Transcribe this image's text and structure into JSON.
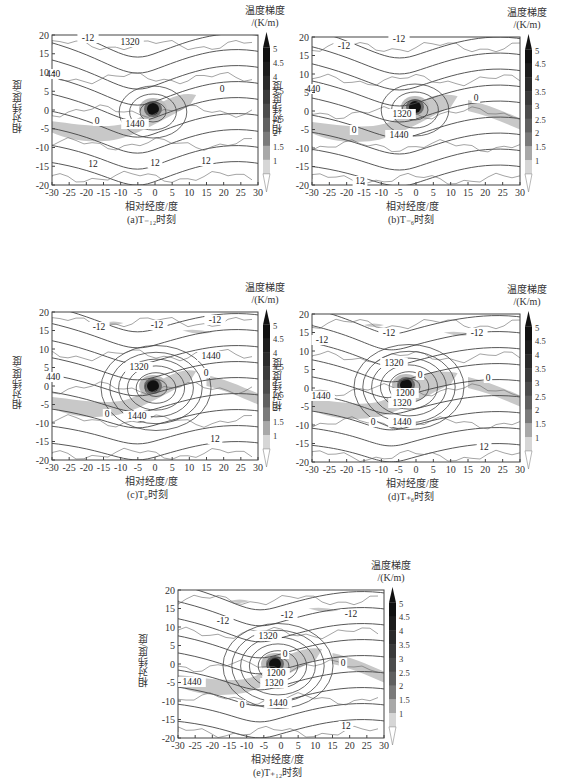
{
  "figure": {
    "colorbar": {
      "title_line1": "温度梯度",
      "title_line2": "/(K/m)",
      "ticks": [
        "5",
        "4.5",
        "4",
        "3.5",
        "3",
        "2.5",
        "2",
        "1.5",
        "1"
      ],
      "shades": [
        "#111111",
        "#1d1d1d",
        "#2a2a2a",
        "#3a3a3a",
        "#4c4c4c",
        "#606060",
        "#7a7a7a",
        "#a8a8a8",
        "#d6d6d6"
      ]
    },
    "xlabel": "相对经度/度",
    "ylabel": "相对纬度/度",
    "xticks": [
      "-30",
      "-25",
      "-20",
      "-15",
      "-10",
      "-5",
      "0",
      "5",
      "10",
      "15",
      "20",
      "25",
      "30"
    ],
    "yticks": [
      "20",
      "15",
      "10",
      "5",
      "0",
      "-5",
      "-10",
      "-15",
      "-20"
    ],
    "panels": [
      {
        "id": "a",
        "caption": "(a)T₋₁₂时刻"
      },
      {
        "id": "b",
        "caption": "(b)T₋₆时刻"
      },
      {
        "id": "c",
        "caption": "(c)T₀时刻"
      },
      {
        "id": "d",
        "caption": "(d)T₊₆时刻"
      },
      {
        "id": "e",
        "caption": "(e)T₊₁₂时刻"
      }
    ]
  },
  "chart_data": [
    {
      "type": "heatmap",
      "title": "(a)T₋₁₂时刻",
      "xlabel": "相对经度/度",
      "ylabel": "相对纬度/度",
      "xlim": [
        -30,
        30
      ],
      "ylim": [
        -20,
        20
      ],
      "colorbar": {
        "label": "温度梯度/(K/m)",
        "range": [
          1,
          5
        ],
        "ticks": [
          1,
          1.5,
          2,
          2.5,
          3,
          3.5,
          4,
          4.5,
          5
        ]
      },
      "contour_labels": [
        "-12",
        "1320",
        "440",
        "0",
        "1440",
        "12",
        "12",
        "12"
      ],
      "max_gradient_center": [
        0,
        0
      ]
    },
    {
      "type": "heatmap",
      "title": "(b)T₋₆时刻",
      "xlabel": "相对经度/度",
      "ylabel": "相对纬度/度",
      "xlim": [
        -30,
        30
      ],
      "ylim": [
        -20,
        20
      ],
      "colorbar": {
        "label": "温度梯度/(K/m)",
        "range": [
          1,
          5
        ],
        "ticks": [
          1,
          1.5,
          2,
          2.5,
          3,
          3.5,
          4,
          4.5,
          5
        ]
      },
      "contour_labels": [
        "-12",
        "-12",
        "440",
        "0",
        "1320",
        "1440",
        "0",
        "12"
      ],
      "max_gradient_center": [
        0,
        1
      ]
    },
    {
      "type": "heatmap",
      "title": "(c)T₀时刻",
      "xlabel": "相对经度/度",
      "ylabel": "相对纬度/度",
      "xlim": [
        -30,
        30
      ],
      "ylim": [
        -20,
        20
      ],
      "colorbar": {
        "label": "温度梯度/(K/m)",
        "range": [
          1,
          5
        ],
        "ticks": [
          1,
          1.5,
          2,
          2.5,
          3,
          3.5,
          4,
          4.5,
          5
        ]
      },
      "contour_labels": [
        "-12",
        "-12",
        "-12",
        "1440",
        "1320",
        "440",
        "0",
        "0",
        "1440",
        "12"
      ],
      "max_gradient_center": [
        0,
        0
      ]
    },
    {
      "type": "heatmap",
      "title": "(d)T₊₆时刻",
      "xlabel": "相对经度/度",
      "ylabel": "相对纬度/度",
      "xlim": [
        -30,
        30
      ],
      "ylim": [
        -20,
        20
      ],
      "colorbar": {
        "label": "温度梯度/(K/m)",
        "range": [
          1,
          5
        ],
        "ticks": [
          1,
          1.5,
          2,
          2.5,
          3,
          3.5,
          4,
          4.5,
          5
        ]
      },
      "contour_labels": [
        "-12",
        "-12",
        "-12",
        "1320",
        "0",
        "0",
        "1200",
        "1440",
        "1320",
        "0",
        "1440",
        "12"
      ],
      "max_gradient_center": [
        -1,
        0
      ]
    },
    {
      "type": "heatmap",
      "title": "(e)T₊₁₂时刻",
      "xlabel": "相对经度/度",
      "ylabel": "相对纬度/度",
      "xlim": [
        -30,
        30
      ],
      "ylim": [
        -20,
        20
      ],
      "colorbar": {
        "label": "温度梯度/(K/m)",
        "range": [
          1,
          5
        ],
        "ticks": [
          1,
          1.5,
          2,
          2.5,
          3,
          3.5,
          4,
          4.5,
          5
        ]
      },
      "contour_labels": [
        "-12",
        "-12",
        "-12",
        "1320",
        "0",
        "0",
        "1200",
        "1440",
        "1320",
        "0",
        "1440",
        "12"
      ],
      "max_gradient_center": [
        -1,
        0
      ]
    }
  ]
}
